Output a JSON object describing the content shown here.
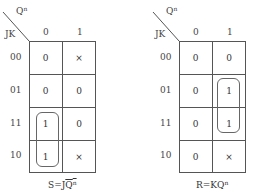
{
  "maps": [
    {
      "id": "S",
      "var_top": "Q",
      "var_top_sup": "n",
      "var_left": "JK",
      "col_labels": [
        "0",
        "1"
      ],
      "row_labels": [
        "00",
        "01",
        "11",
        "10"
      ],
      "cells": [
        [
          "0",
          "×"
        ],
        [
          "0",
          "0"
        ],
        [
          "1",
          "0"
        ],
        [
          "1",
          "×"
        ]
      ],
      "loop": {
        "col": 0,
        "rows": [
          2,
          3
        ]
      },
      "equation": {
        "lhs": "S=J",
        "var": "Q",
        "sup": "n",
        "overlined": true
      }
    },
    {
      "id": "R",
      "var_top": "Q",
      "var_top_sup": "n",
      "var_left": "JK",
      "col_labels": [
        "0",
        "1"
      ],
      "row_labels": [
        "00",
        "01",
        "11",
        "10"
      ],
      "cells": [
        [
          "0",
          "0"
        ],
        [
          "0",
          "1"
        ],
        [
          "0",
          "1"
        ],
        [
          "0",
          "×"
        ]
      ],
      "loop": {
        "col": 1,
        "rows": [
          1,
          2
        ]
      },
      "equation": {
        "lhs": "R=K",
        "var": "Q",
        "sup": "n",
        "overlined": false
      }
    }
  ],
  "colors": {
    "line": "#555555",
    "text": "#333333",
    "background": "#ffffff"
  }
}
